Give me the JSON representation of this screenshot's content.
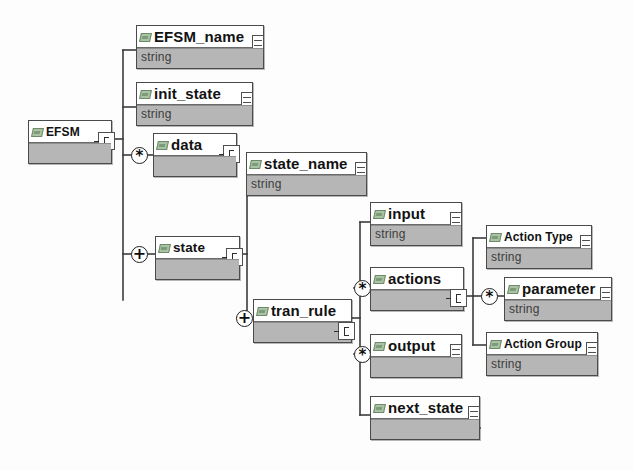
{
  "diagram": {
    "line_color": "#3c3c3c",
    "node_body_color": "#b6b6b6",
    "node_border_color": "#4a4a4a",
    "element_badge_color": "#a9c4a4"
  },
  "nodes": {
    "efsm": {
      "label": "EFSM",
      "type": ""
    },
    "efsm_name": {
      "label": "EFSM_name",
      "type": "string"
    },
    "init_state": {
      "label": "init_state",
      "type": "string"
    },
    "data": {
      "label": "data",
      "type": ""
    },
    "state": {
      "label": "state",
      "type": ""
    },
    "state_name": {
      "label": "state_name",
      "type": "string"
    },
    "tran_rule": {
      "label": "tran_rule",
      "type": ""
    },
    "input": {
      "label": "input",
      "type": "string"
    },
    "actions": {
      "label": "actions",
      "type": ""
    },
    "output": {
      "label": "output",
      "type": ""
    },
    "next_state": {
      "label": "next_state",
      "type": ""
    },
    "action_type": {
      "label": "Action Type",
      "type": "string"
    },
    "parameter": {
      "label": "parameter",
      "type": "string"
    },
    "action_group": {
      "label": "Action Group",
      "type": "string"
    }
  },
  "connectors": {
    "data_star": {
      "symbol": "*",
      "meaning": "zero-or-more"
    },
    "state_plus": {
      "symbol": "+",
      "meaning": "one-or-more"
    },
    "tran_rule_plus": {
      "symbol": "+",
      "meaning": "one-or-more"
    },
    "actions_star": {
      "symbol": "*",
      "meaning": "zero-or-more"
    },
    "output_star": {
      "symbol": "*",
      "meaning": "zero-or-more"
    },
    "parameter_star": {
      "symbol": "*",
      "meaning": "zero-or-more"
    }
  }
}
